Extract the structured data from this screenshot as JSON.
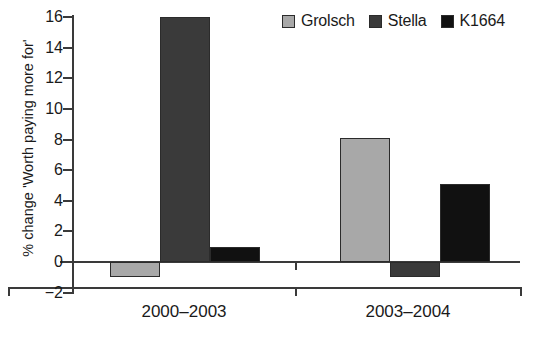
{
  "chart_data": {
    "type": "bar",
    "title": "",
    "subtitle": "",
    "xlabel": "",
    "ylabel": "% change 'Worth paying more for'",
    "categories": [
      "2000–2003",
      "2003–2004"
    ],
    "series": [
      {
        "name": "Grolsch",
        "color": "#a8a8a8",
        "values": [
          -1.0,
          8.1
        ]
      },
      {
        "name": "Stella",
        "color": "#3a3a3a",
        "values": [
          16.0,
          -1.0
        ]
      },
      {
        "name": "K1664",
        "color": "#111111",
        "values": [
          1.0,
          5.1
        ]
      }
    ],
    "ylim": [
      -2,
      16
    ],
    "ytick_step": 2,
    "ytick_labels": [
      "16",
      "14",
      "12",
      "10",
      "8",
      "6",
      "4",
      "2",
      "0",
      "−2"
    ],
    "ytick_values": [
      16,
      14,
      12,
      10,
      8,
      6,
      4,
      2,
      0,
      -2
    ],
    "grid": false,
    "legend_position": "top-right",
    "legend_entries": [
      "Grolsch",
      "Stella",
      "K1664"
    ],
    "annotations": []
  },
  "legend": {
    "items": [
      {
        "label": "Grolsch",
        "color": "#a8a8a8"
      },
      {
        "label": "Stella",
        "color": "#3a3a3a"
      },
      {
        "label": "K1664",
        "color": "#111111"
      }
    ]
  },
  "axes": {
    "y_title": "% change 'Worth paying more for'",
    "y_ticks": [
      "16",
      "14",
      "12",
      "10",
      "8",
      "6",
      "4",
      "2",
      "0",
      "−2"
    ],
    "x_categories": [
      "2000–2003",
      "2003–2004"
    ]
  },
  "colors": {
    "grolsch": "#a8a8a8",
    "stella": "#3a3a3a",
    "k1664": "#111111",
    "axis": "#3a3a3a",
    "text": "#1a1a1a",
    "background": "#ffffff"
  }
}
